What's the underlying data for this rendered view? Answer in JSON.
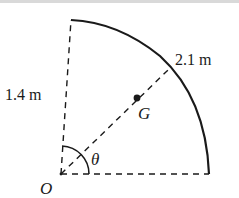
{
  "diagram": {
    "type": "quarter-circle sector with center of mass",
    "labels": {
      "vertical_length": "1.4 m",
      "arc_length": "2.1 m",
      "center_of_mass": "G",
      "angle": "θ",
      "origin": "O"
    },
    "colors": {
      "stroke": "#1a1a1a",
      "background": "#ffffff"
    }
  }
}
